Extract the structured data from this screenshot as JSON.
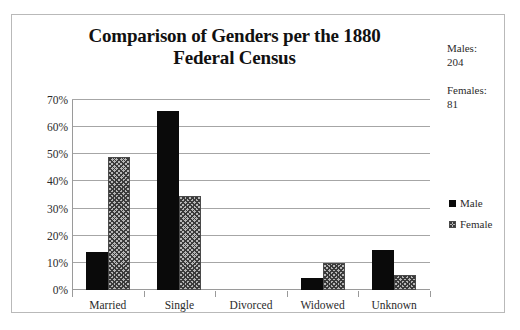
{
  "chart_data": {
    "type": "bar",
    "title": "Comparison of Genders per the 1880 Federal Census",
    "title_line1": "Comparison of Genders per the 1880",
    "title_line2": "Federal Census",
    "xlabel": "",
    "ylabel": "",
    "categories": [
      "Married",
      "Single",
      "Divorced",
      "Widowed",
      "Unknown"
    ],
    "series": [
      {
        "name": "Male",
        "values": [
          14.0,
          66.0,
          0.0,
          4.4,
          14.7
        ]
      },
      {
        "name": "Female",
        "values": [
          49.0,
          34.5,
          0.0,
          10.0,
          5.4
        ]
      }
    ],
    "ylim": [
      0,
      70
    ],
    "ytick_values": [
      70,
      60,
      50,
      40,
      30,
      20,
      10,
      0
    ],
    "ytick_labels": [
      "70%",
      "60%",
      "50%",
      "40%",
      "30%",
      "20%",
      "10%",
      "0%"
    ],
    "grid": true,
    "legend_position": "right",
    "value_unit": "percent",
    "colors": {
      "male_fill": "#0a0a0a",
      "female_fill": "#b6b6b6",
      "female_hatch": "#3a3a3a",
      "gridline": "#a6a6a6",
      "axis": "#9a9a9a",
      "text": "#2b2b2b",
      "border": "#b9b9b9",
      "background": "#ffffff"
    }
  },
  "legend": {
    "items": [
      {
        "label": "Male",
        "swatch": "solid-black-square"
      },
      {
        "label": "Female",
        "swatch": "hatched-gray-square"
      }
    ]
  },
  "side_stats": [
    {
      "label": "Males:",
      "value": "204"
    },
    {
      "label": "Females:",
      "value": "81"
    }
  ]
}
